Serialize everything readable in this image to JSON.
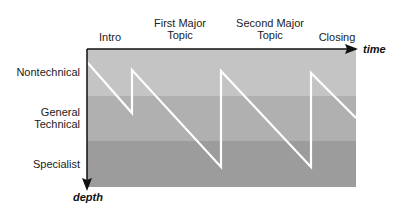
{
  "diagram": {
    "x_axis": {
      "label": "time"
    },
    "y_axis": {
      "label": "depth"
    },
    "phases": [
      {
        "label": "Intro"
      },
      {
        "label_line1": "First Major",
        "label_line2": "Topic"
      },
      {
        "label_line1": "Second Major",
        "label_line2": "Topic"
      },
      {
        "label": "Closing"
      }
    ],
    "levels": [
      {
        "label": "Nontechnical",
        "color": "#c4c4c4"
      },
      {
        "label_line1": "General",
        "label_line2": "Technical",
        "color": "#b0b0b0"
      },
      {
        "label": "Specialist",
        "color": "#9c9c9c"
      }
    ],
    "line_color": "#ffffff",
    "axis_color": "#111111"
  }
}
